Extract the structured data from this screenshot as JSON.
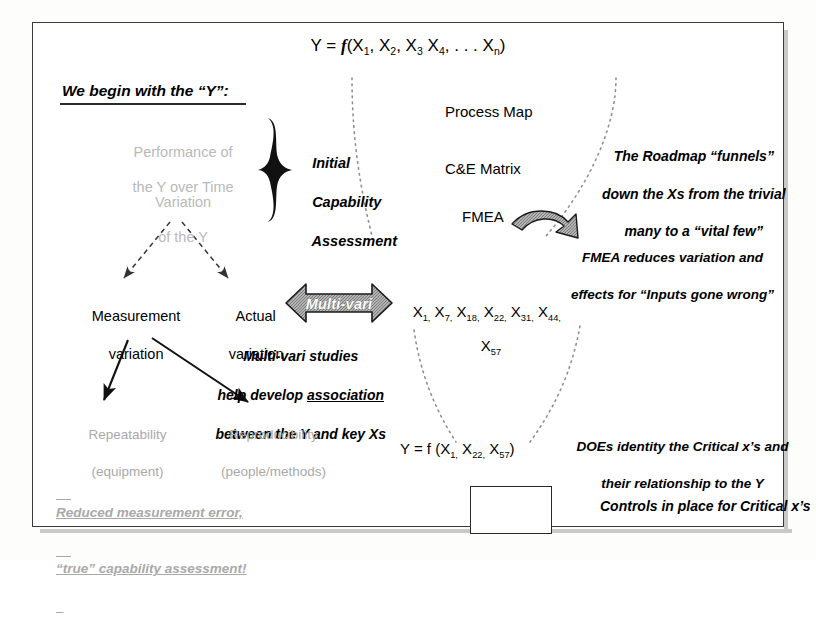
{
  "diagram": {
    "title_equation": {
      "lhs": "Y = ",
      "fn": "f",
      "args": "(X1, X2, X3 X4, . . . Xn)",
      "plain": "Y = f(X1, X2, X3 X4, . . . Xn)"
    },
    "left_column": {
      "header": "We begin with the “Y”:",
      "performance": "Performance of\nthe Y over Time",
      "performance_line1": "Performance of",
      "performance_line2": "the Y over Time",
      "variation": "Variation\nof the Y",
      "variation_line1": "Variation",
      "variation_line2": "of the Y",
      "brace_label": "Initial\nCapability\nAssessment",
      "brace_label_l1": "Initial",
      "brace_label_l2": "Capability",
      "brace_label_l3": "Assessment"
    },
    "funnel_tools": {
      "process_map": "Process Map",
      "ce_matrix": "C&E Matrix",
      "fmea": "FMEA"
    },
    "annotations": {
      "roadmap": "The Roadmap “funnels”\ndown the Xs from the trivial\nmany to a “vital few”",
      "roadmap_l1": "The Roadmap “funnels”",
      "roadmap_l2": "down the Xs from the trivial",
      "roadmap_l3": "many to a “vital few”",
      "fmea_note_l1": "FMEA reduces variation and",
      "fmea_note_l2": "effects for “Inputs gone wrong”",
      "multivari_note_l1": "Multi-vari studies",
      "multivari_note_l2a": "help develop ",
      "multivari_note_l2b": "association",
      "multivari_note_l3": "between the Y and key Xs",
      "doe_note_l1": "DOEs identity the Critical x’s and",
      "doe_note_l2": "their relationship to the Y",
      "controls_note": "Controls in place for Critical x’s"
    },
    "variation_branch": {
      "measurement_l1": "Measurement",
      "measurement_l2": "variation",
      "actual_l1": "Actual",
      "actual_l2": "variation",
      "repeatability_l1": "Repeatability",
      "repeatability_l2": "(equipment)",
      "reproducibility_l1": "Reproducibility",
      "reproducibility_l2": "(people/methods)",
      "reduced_l1": "Reduced measurement error,",
      "reduced_l2": "“true” capability assessment!"
    },
    "multivari_arrow_label": "Multi-vari",
    "x_list": {
      "line1": "X1, X7, X18, X22, X31, X44,",
      "line2": "X57",
      "items_line1": [
        "X1,",
        "X7,",
        "X18,",
        "X22,",
        "X31,",
        "X44,"
      ],
      "items_line2": [
        "X57"
      ]
    },
    "bottom_equation": {
      "plain": "Y = f (X1, X22, X57)",
      "lhs": "Y = f (",
      "rhs": ")"
    },
    "control_chart": {
      "name": "control-chart-thumbnail",
      "description": "small individuals control chart with center line and upper/lower control limits"
    },
    "colors": {
      "ink": "#000000",
      "faded_text": "#b9b9b9",
      "frame": "#3a3a3a",
      "arrow_fill": "#8c8c8c",
      "paper": "#ffffff"
    }
  }
}
